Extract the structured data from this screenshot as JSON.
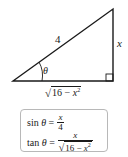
{
  "diagram": {
    "type": "right-triangle",
    "hypotenuse_label": "4",
    "opposite_label": "x",
    "angle_label": "θ",
    "adjacent_label": {
      "radicand_num": "16 − ",
      "radicand_var": "x",
      "exponent": "2",
      "radical": "√"
    },
    "line_color": "#1a1a1a"
  },
  "formulas": {
    "sin": {
      "func": "sin",
      "var": "θ",
      "eq": "=",
      "numerator": "x",
      "denominator": "4"
    },
    "tan": {
      "func": "tan",
      "var": "θ",
      "eq": "=",
      "numerator": "x",
      "radical": "√",
      "radicand_num": "16 − ",
      "radicand_var": "x",
      "exponent": "2"
    }
  }
}
